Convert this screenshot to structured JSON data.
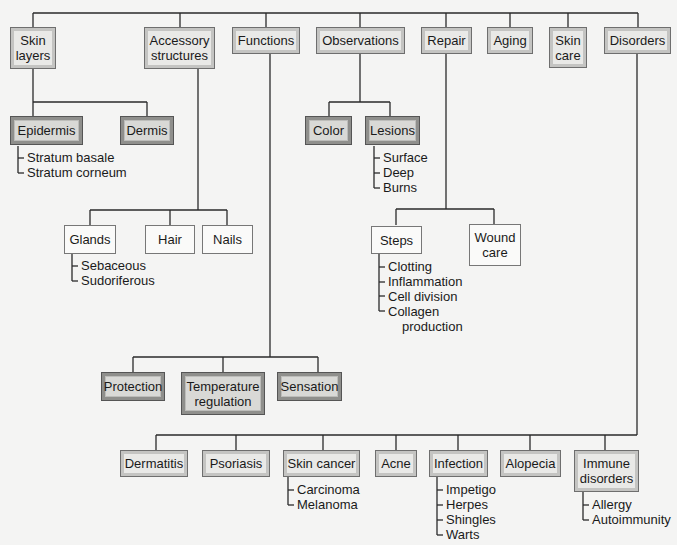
{
  "diagram": {
    "title": "",
    "top_level": [
      {
        "id": "skin-layers",
        "label": "Skin layers",
        "lines": [
          "Skin",
          "layers"
        ]
      },
      {
        "id": "accessory-structures",
        "label": "Accessory structures",
        "lines": [
          "Accessory",
          "structures"
        ]
      },
      {
        "id": "functions",
        "label": "Functions"
      },
      {
        "id": "observations",
        "label": "Observations"
      },
      {
        "id": "repair",
        "label": "Repair"
      },
      {
        "id": "aging",
        "label": "Aging"
      },
      {
        "id": "skin-care",
        "label": "Skin care",
        "lines": [
          "Skin",
          "care"
        ]
      },
      {
        "id": "disorders",
        "label": "Disorders"
      }
    ],
    "skin_layers": {
      "children": [
        {
          "label": "Epidermis",
          "items": [
            "Stratum basale",
            "Stratum corneum"
          ]
        },
        {
          "label": "Dermis"
        }
      ]
    },
    "accessory_structures": {
      "children": [
        {
          "label": "Glands",
          "items": [
            "Sebaceous",
            "Sudoriferous"
          ]
        },
        {
          "label": "Hair"
        },
        {
          "label": "Nails"
        }
      ]
    },
    "functions": {
      "children": [
        {
          "label": "Protection"
        },
        {
          "label": "Temperature regulation",
          "lines": [
            "Temperature",
            "regulation"
          ]
        },
        {
          "label": "Sensation"
        }
      ]
    },
    "observations": {
      "children": [
        {
          "label": "Color"
        },
        {
          "label": "Lesions",
          "items": [
            "Surface",
            "Deep",
            "Burns"
          ]
        }
      ]
    },
    "repair": {
      "children": [
        {
          "label": "Steps",
          "items": [
            "Clotting",
            "Inflammation",
            "Cell division",
            "Collagen",
            "production"
          ]
        },
        {
          "label": "Wound care",
          "lines": [
            "Wound",
            "care"
          ]
        }
      ]
    },
    "disorders": {
      "children": [
        {
          "label": "Dermatitis"
        },
        {
          "label": "Psoriasis"
        },
        {
          "label": "Skin cancer",
          "items": [
            "Carcinoma",
            "Melanoma"
          ]
        },
        {
          "label": "Acne"
        },
        {
          "label": "Infection",
          "items": [
            "Impetigo",
            "Herpes",
            "Shingles",
            "Warts"
          ]
        },
        {
          "label": "Alopecia"
        },
        {
          "label": "Immune disorders",
          "lines": [
            "Immune",
            "disorders"
          ],
          "items": [
            "Allergy",
            "Autoimmunity"
          ]
        }
      ]
    }
  },
  "colors": {
    "background": "#f4f4f3",
    "line": "#2a2a2a",
    "box_light": "#f6f6f4",
    "box_dark": "#d9d9d6"
  }
}
